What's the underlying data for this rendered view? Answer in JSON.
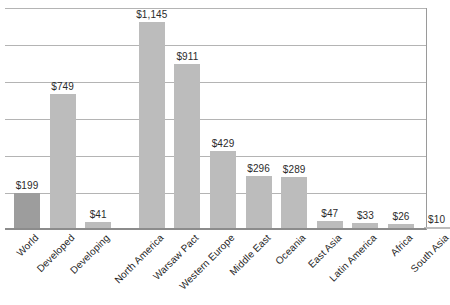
{
  "chart_data": {
    "type": "bar",
    "title": "",
    "subtitle": "",
    "xlabel": "",
    "ylabel": "",
    "grid": true,
    "legend": false,
    "ylim": [
      0,
      1228
    ],
    "gridline_count": 6,
    "value_prefix": "$",
    "categories": [
      "World",
      "Developed",
      "Developing",
      "North America",
      "Warsaw Pact",
      "Western Europe",
      "Middle East",
      "Oceania",
      "East Asia",
      "Latin America",
      "Africa",
      "South Asia"
    ],
    "values": [
      199,
      749,
      41,
      1145,
      911,
      429,
      296,
      289,
      47,
      33,
      26,
      10
    ],
    "labels": [
      "$199",
      "$749",
      "$41",
      "$1,145",
      "$911",
      "$429",
      "$296",
      "$289",
      "$47",
      "$33",
      "$26",
      "$10"
    ],
    "bar_colors": [
      "#9d9d9d",
      "#bcbcbc",
      "#bcbcbc",
      "#bcbcbc",
      "#bcbcbc",
      "#bcbcbc",
      "#bcbcbc",
      "#bcbcbc",
      "#bcbcbc",
      "#bcbcbc",
      "#bcbcbc",
      "#bcbcbc"
    ],
    "colors": {
      "highlight_bar": "#9d9d9d",
      "bar": "#bcbcbc",
      "gridline": "#b4b4b4",
      "axis": "#8c8c8c",
      "text": "#1f1f1f",
      "background": "#ffffff"
    },
    "group_gap_after_index": 2
  }
}
